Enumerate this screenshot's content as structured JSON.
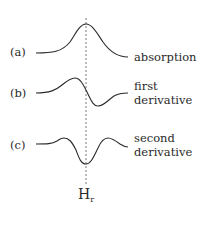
{
  "figure": {
    "marker_line": {
      "label": "H",
      "subscript": "r",
      "style": "dashed"
    },
    "curves": [
      {
        "id": "a",
        "tag": "(a)",
        "label_line1": "absorption",
        "label_line2": ""
      },
      {
        "id": "b",
        "tag": "(b)",
        "label_line1": "first",
        "label_line2": "derivative"
      },
      {
        "id": "c",
        "tag": "(c)",
        "label_line1": "second",
        "label_line2": "derivative"
      }
    ],
    "colors": {
      "line": "#2a2a2a",
      "dashed": "#777777"
    }
  }
}
